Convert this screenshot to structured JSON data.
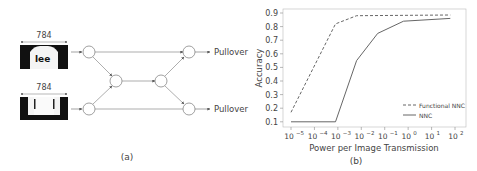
{
  "panel_a": {
    "caption": "(a)",
    "inputs": [
      {
        "dim_label": "784",
        "image": "fashion-mnist-shirt"
      },
      {
        "dim_label": "784",
        "image": "fashion-mnist-trousers"
      }
    ],
    "outputs": [
      "Pullover",
      "Pullover"
    ],
    "node_count": 6
  },
  "panel_b": {
    "caption": "(b)"
  },
  "chart_data": {
    "type": "line",
    "title": "",
    "xlabel": "Power per Image Transmission",
    "ylabel": "Accuracy",
    "xscale": "log",
    "xticks": [
      "10^-5",
      "10^-4",
      "10^-3",
      "10^-2",
      "10^-1",
      "10^0",
      "10^1",
      "10^2"
    ],
    "xtick_exponents": [
      -5,
      -4,
      -3,
      -2,
      -1,
      0,
      1,
      2
    ],
    "yticks": [
      0.1,
      0.2,
      0.3,
      0.4,
      0.5,
      0.6,
      0.7,
      0.8,
      0.9
    ],
    "ylim": [
      0.08,
      0.92
    ],
    "grid": false,
    "legend_position": "lower right",
    "series": [
      {
        "name": "Functional NNC",
        "style": "dashed",
        "color": "#555555",
        "x_log10": [
          -5,
          -3.1,
          -2.2,
          1.8
        ],
        "values": [
          0.17,
          0.82,
          0.88,
          0.885
        ]
      },
      {
        "name": "NNC",
        "style": "solid",
        "color": "#555555",
        "x_log10": [
          -5,
          -3.1,
          -2.2,
          -1.3,
          -0.2,
          1.8
        ],
        "values": [
          0.1,
          0.1,
          0.55,
          0.75,
          0.84,
          0.86
        ]
      }
    ]
  }
}
